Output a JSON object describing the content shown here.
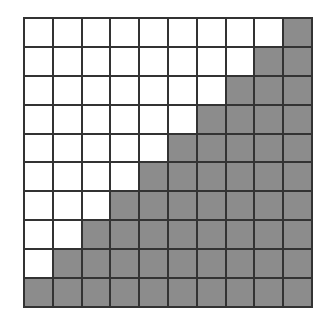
{
  "diagram": {
    "type": "grid",
    "rows": 10,
    "cols": 10,
    "colors": {
      "empty": "#ffffff",
      "shaded": "#8c8c8c",
      "line": "#333333"
    },
    "shaded_cells_per_row": [
      1,
      2,
      3,
      4,
      5,
      6,
      7,
      8,
      9,
      10
    ],
    "shaded_alignment": "right",
    "total_shaded": 55,
    "total_cells": 100
  }
}
